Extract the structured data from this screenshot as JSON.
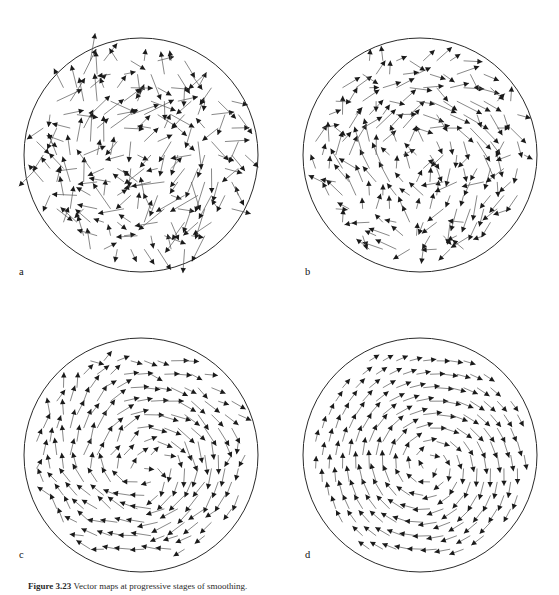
{
  "figure": {
    "panels": [
      {
        "id": "a",
        "label": "a"
      },
      {
        "id": "b",
        "label": "b"
      },
      {
        "id": "c",
        "label": "c"
      },
      {
        "id": "d",
        "label": "d"
      }
    ],
    "caption_prefix": "Figure",
    "caption_number": "3.23",
    "caption_text": "Vector maps at progressive stages of smoothing.",
    "caption_visible": "partially-cropped"
  },
  "style": {
    "circle_stroke": "#2b2b2b",
    "arrow_color": "#1a1a1a",
    "tail_color": "#555555",
    "background": "#ffffff"
  },
  "chart_data": {
    "type": "scatter",
    "title": "",
    "xlabel": "",
    "ylabel": "",
    "panel_count": 4,
    "domain": "unit circle",
    "quantity": "2-D velocity vector field (quiver)",
    "panels": [
      {
        "id": "a",
        "label": "a",
        "description": "raw noisy vector field, weak coherent rotation",
        "noise_level": 1.0,
        "smoothing_iterations": 0,
        "vortex_center": [
          0.05,
          -0.05
        ],
        "circle": {
          "cx": 141,
          "cy": 145,
          "r": 117
        },
        "n_vectors": 170
      },
      {
        "id": "b",
        "label": "b",
        "description": "lightly smoothed field, rotation beginning to emerge",
        "noise_level": 0.65,
        "smoothing_iterations": 1,
        "vortex_center": [
          0.05,
          -0.05
        ],
        "circle": {
          "cx": 141,
          "cy": 145,
          "r": 117
        },
        "n_vectors": 170
      },
      {
        "id": "c",
        "label": "c",
        "description": "moderately smoothed field, clear single vortex",
        "noise_level": 0.32,
        "smoothing_iterations": 3,
        "vortex_center": [
          0.05,
          -0.08
        ],
        "circle": {
          "cx": 141,
          "cy": 145,
          "r": 117
        },
        "n_vectors": 170
      },
      {
        "id": "d",
        "label": "d",
        "description": "fully smoothed field, coherent clockwise vortex",
        "noise_level": 0.08,
        "smoothing_iterations": 8,
        "vortex_center": [
          0.08,
          -0.1
        ],
        "circle": {
          "cx": 141,
          "cy": 145,
          "r": 117
        },
        "n_vectors": 170
      }
    ]
  }
}
